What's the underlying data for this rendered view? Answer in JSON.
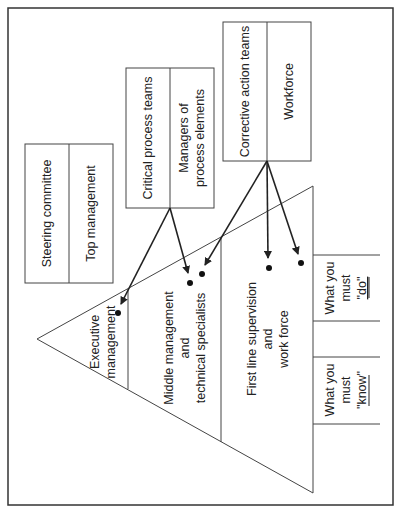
{
  "diagram": {
    "colors": {
      "line": "#333333",
      "text": "#222222",
      "background": "#ffffff"
    },
    "boxes": {
      "steering": {
        "left": "Steering committee",
        "right": "Top management"
      },
      "critical": {
        "left": "Critical process teams",
        "right_line1": "Managers of",
        "right_line2": "process elements"
      },
      "corrective": {
        "left": "Corrective action teams",
        "right": "Workforce"
      }
    },
    "pyramid": {
      "tier1": {
        "line1": "Executive",
        "line2": "management"
      },
      "tier2": {
        "line1": "Middle management",
        "line2": "and",
        "line3": "technical specialists"
      },
      "tier3": {
        "line1": "First line supervision",
        "line2": "and",
        "line3": "work force"
      }
    },
    "side_boxes": {
      "do": {
        "line1": "What you",
        "line2": "must",
        "line3": "\"do\""
      },
      "know": {
        "line1": "What you",
        "line2": "must",
        "line3": "\"know\""
      }
    }
  }
}
